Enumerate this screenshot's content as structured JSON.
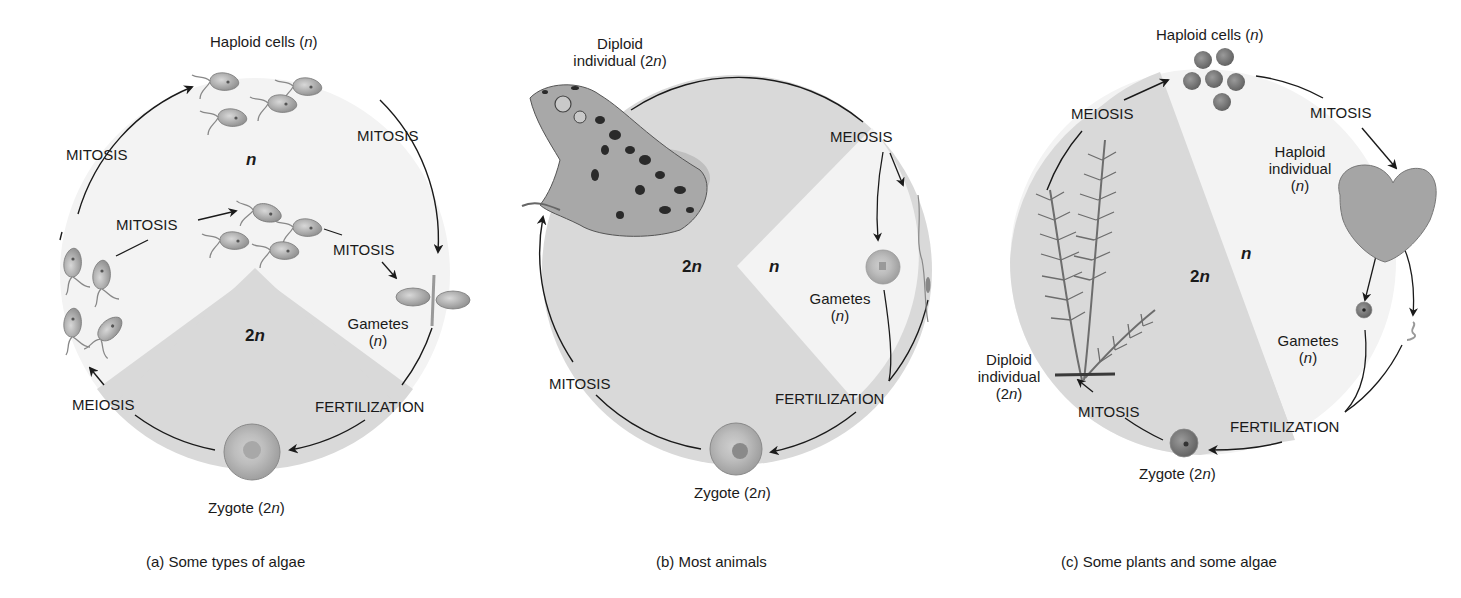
{
  "figure": {
    "panels": [
      {
        "id": "a",
        "caption": "(a) Some types of algae",
        "labels": {
          "haploid_cells": "Haploid cells (",
          "haploid_cells_n": "n",
          "haploid_cells_end": ")",
          "mitosis_left": "MITOSIS",
          "mitosis_right": "MITOSIS",
          "mitosis_inner_left": "MITOSIS",
          "mitosis_inner_right": "MITOSIS",
          "ploidy_n": "n",
          "ploidy_2n_num": "2",
          "ploidy_2n_n": "n",
          "gametes": "Gametes",
          "gametes_n": "n",
          "meiosis": "MEIOSIS",
          "fertilization": "FERTILIZATION",
          "zygote": "Zygote (2",
          "zygote_n": "n",
          "zygote_end": ")"
        }
      },
      {
        "id": "b",
        "caption": "(b) Most animals",
        "labels": {
          "diploid_line1": "Diploid",
          "diploid_line2": "individual (2",
          "diploid_n": "n",
          "diploid_end": ")",
          "meiosis": "MEIOSIS",
          "ploidy_2n_num": "2",
          "ploidy_2n_n": "n",
          "ploidy_n": "n",
          "gametes": "Gametes",
          "gametes_n": "n",
          "mitosis": "MITOSIS",
          "fertilization": "FERTILIZATION",
          "zygote": "Zygote (2",
          "zygote_n": "n",
          "zygote_end": ")"
        }
      },
      {
        "id": "c",
        "caption": "(c) Some plants and some algae",
        "labels": {
          "haploid_cells": "Haploid cells (",
          "haploid_cells_n": "n",
          "haploid_cells_end": ")",
          "meiosis": "MEIOSIS",
          "mitosis_top": "MITOSIS",
          "haploid_ind_line1": "Haploid",
          "haploid_ind_line2": "individual",
          "haploid_ind_n": "n",
          "ploidy_n": "n",
          "ploidy_2n_num": "2",
          "ploidy_2n_n": "n",
          "gametes": "Gametes",
          "gametes_n": "n",
          "diploid_line1": "Diploid",
          "diploid_line2": "individual",
          "diploid_n": "n",
          "mitosis_bottom": "MITOSIS",
          "fertilization": "FERTILIZATION",
          "zygote": "Zygote (2",
          "zygote_n": "n",
          "zygote_end": ")"
        }
      }
    ],
    "colors": {
      "diploid_shade": "#d9d9d9",
      "haploid_shade": "#f3f3f3",
      "cell_fill": "#b5b5b5",
      "line": "#1a1a1a"
    }
  }
}
